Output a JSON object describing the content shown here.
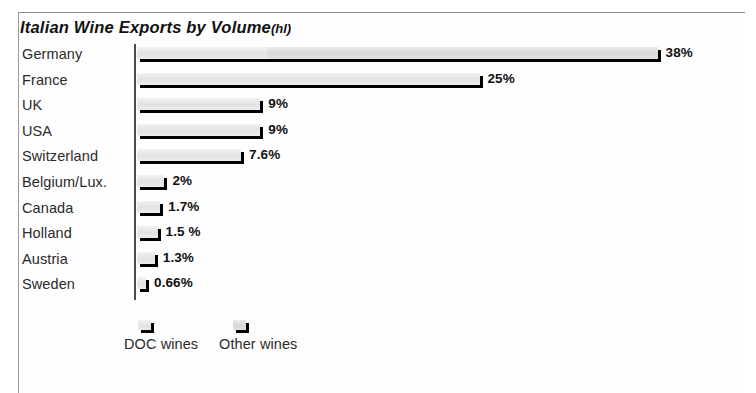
{
  "chart_data": {
    "type": "bar",
    "orientation": "horizontal",
    "title": "Italian Wine Exports by Volume",
    "title_unit": "(hl)",
    "xlabel": "",
    "ylabel": "",
    "grid": false,
    "legend_position": "bottom-left",
    "categories": [
      "Germany",
      "France",
      "UK",
      "USA",
      "Switzerland",
      "Belgium/Lux.",
      "Canada",
      "Holland",
      "Austria",
      "Sweden"
    ],
    "values": [
      38,
      25,
      9,
      9,
      7.6,
      2,
      1.7,
      1.5,
      1.3,
      0.66
    ],
    "value_labels": [
      "38%",
      "25%",
      "9%",
      "9%",
      "7.6%",
      "2%",
      "1.7%",
      "1.5 %",
      "1.3%",
      "0.66%"
    ],
    "series": [
      {
        "name": "DOC wines",
        "values": [
          9.5,
          25,
          9,
          9,
          7.6,
          2,
          1.7,
          1.5,
          1.3,
          0.66
        ]
      },
      {
        "name": "Other wines",
        "values": [
          28.5,
          0,
          0,
          0,
          0,
          0,
          0,
          0,
          0,
          0
        ]
      }
    ],
    "xlim": [
      0,
      38
    ],
    "units": "percent"
  },
  "legend": {
    "items": [
      {
        "label": "DOC wines",
        "swatch": "doc-wines-swatch"
      },
      {
        "label": "Other wines",
        "swatch": "other-wines-swatch"
      }
    ]
  }
}
